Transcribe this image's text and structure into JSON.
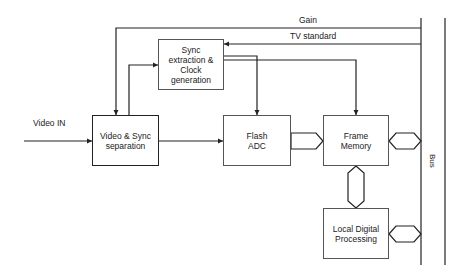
{
  "diagram": {
    "type": "block-diagram",
    "blocks": {
      "video_sync_sep": "Video & Sync separation",
      "sync_extraction": "Sync extraction & Clock generation",
      "flash_adc": "Flash ADC",
      "frame_memory": "Frame Memory",
      "local_processing": "Local Digital Processing"
    },
    "signals": {
      "video_in": "Video IN",
      "gain": "Gain",
      "tv_standard": "TV standard",
      "bus": "Bus"
    },
    "colors": {
      "line": "#222222",
      "box_border": "#555555",
      "background": "#ffffff"
    }
  }
}
